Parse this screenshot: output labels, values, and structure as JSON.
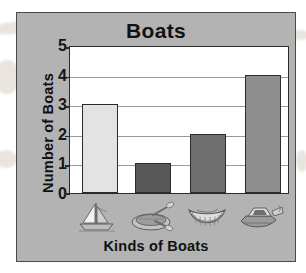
{
  "chart_data": {
    "type": "bar",
    "title": "Boats",
    "xlabel": "Kinds of Boats",
    "ylabel": "Number of Boats",
    "categories": [
      "sailboat",
      "rowboat",
      "canoe",
      "motorboat"
    ],
    "values": [
      3,
      1,
      2,
      4
    ],
    "ylim": [
      0,
      5
    ],
    "yticks": [
      "5",
      "4",
      "3",
      "2",
      "1",
      "0"
    ],
    "grid": true,
    "legend": "none",
    "bar_colors": [
      "#e3e3e3",
      "#585858",
      "#6e6e6e",
      "#8e8e8e"
    ],
    "category_icons": [
      "sailboat-icon",
      "rowboat-icon",
      "canoe-icon",
      "motorboat-icon"
    ]
  },
  "card": {
    "background_color": "#b3b3b3",
    "border_color": "#4a4a4a"
  },
  "plot": {
    "background_color": "#ffffff",
    "axis_color": "#2a2a2a",
    "gridline_color": "#9a9a9a"
  }
}
